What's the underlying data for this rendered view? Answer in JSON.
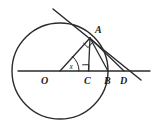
{
  "figure": {
    "type": "geometry-diagram",
    "background_color": "#ffffff",
    "stroke_color": "#2b2b2b",
    "label_color": "#1c1c1c",
    "canvas": {
      "width": 157,
      "height": 138
    },
    "circle": {
      "name": "main-circle",
      "center_label": "O",
      "cx": 60,
      "cy": 71,
      "r": 48,
      "stroke_width": 1.4
    },
    "points": [
      {
        "id": "O",
        "label": "O",
        "x": 60,
        "y": 71,
        "label_x": 41,
        "label_y": 84,
        "role": "center"
      },
      {
        "id": "C",
        "label": "C",
        "x": 88,
        "y": 71,
        "label_x": 84,
        "label_y": 84,
        "role": "foot-of-perpendicular"
      },
      {
        "id": "B",
        "label": "B",
        "x": 108,
        "y": 71,
        "label_x": 104,
        "label_y": 84,
        "role": "circle-axis-intersection"
      },
      {
        "id": "D",
        "label": "D",
        "x": 124,
        "y": 71,
        "label_x": 120,
        "label_y": 84,
        "role": "point-on-axis"
      },
      {
        "id": "A",
        "label": "A",
        "x": 90,
        "y": 38,
        "label_x": 95,
        "label_y": 33,
        "role": "tangent-point"
      }
    ],
    "segments": [
      {
        "name": "horizontal-axis",
        "x1": 18,
        "y1": 71,
        "x2": 150,
        "y2": 71,
        "stroke_width": 1.3
      },
      {
        "name": "radius-OA",
        "x1": 60,
        "y1": 71,
        "x2": 90,
        "y2": 38,
        "stroke_width": 1.3
      },
      {
        "name": "perpendicular-AC",
        "x1": 90,
        "y1": 38,
        "x2": 88.5,
        "y2": 71,
        "stroke_width": 1.3
      },
      {
        "name": "chord-AB",
        "x1": 90,
        "y1": 38,
        "x2": 108,
        "y2": 71,
        "stroke_width": 1.3
      },
      {
        "name": "segment-AD",
        "x1": 90,
        "y1": 38,
        "x2": 124,
        "y2": 71,
        "stroke_width": 1.3
      },
      {
        "name": "tangent-line",
        "x1": 53,
        "y1": 9,
        "x2": 141,
        "y2": 80,
        "stroke_width": 1.5
      }
    ],
    "angle_marks": [
      {
        "name": "angle-x-at-O",
        "label": "x",
        "label_x": 70,
        "label_y": 68,
        "arc_path": "M 79 71 A 19 19 0 0 0 72.2 56.3"
      },
      {
        "name": "right-angle-at-C",
        "path": "M 82.6 64.8 L 88.9 64.7 L 88.8 71"
      },
      {
        "name": "right-angle-at-A",
        "path": "M 83.5 43.5 L 88.0 47.8 L 91.8 43.4"
      }
    ],
    "labels": {
      "O": "O",
      "A": "A",
      "B": "B",
      "C": "C",
      "D": "D",
      "angle": "x"
    }
  }
}
